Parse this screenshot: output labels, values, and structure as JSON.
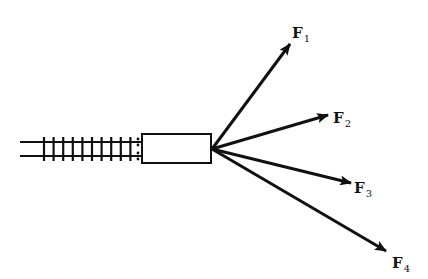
{
  "diagram": {
    "colors": {
      "stroke": "#111111",
      "background": "#ffffff"
    },
    "track": {
      "rail_top_y": 142,
      "rail_bottom_y": 156,
      "start_x": 20,
      "end_x": 142,
      "tie_count": 10,
      "tie_start_x": 44,
      "tie_spacing": 9.6
    },
    "car": {
      "x": 142,
      "y": 134,
      "width": 69,
      "height": 29
    },
    "origin": {
      "x": 212,
      "y": 149
    },
    "forces": [
      {
        "name": "F",
        "subscript": "1",
        "tip": [
          290,
          44
        ],
        "label_pos": [
          292,
          38
        ]
      },
      {
        "name": "F",
        "subscript": "2",
        "tip": [
          328,
          115
        ],
        "label_pos": [
          333,
          123
        ]
      },
      {
        "name": "F",
        "subscript": "3",
        "tip": [
          351,
          183
        ],
        "label_pos": [
          354,
          193
        ]
      },
      {
        "name": "F",
        "subscript": "4",
        "tip": [
          386,
          251
        ],
        "label_pos": [
          392,
          268
        ]
      }
    ]
  }
}
